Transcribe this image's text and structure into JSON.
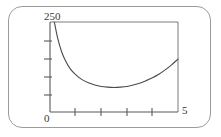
{
  "figure": {
    "name": "cost-curve-figure",
    "frame_style": "rounded-rectangle",
    "background_color": "#ffffff",
    "line_color": "#4a4a4a"
  },
  "chart_data": {
    "type": "line",
    "title": "",
    "subtitle": "",
    "xlabel": "",
    "ylabel": "",
    "xlim": [
      0,
      5
    ],
    "ylim": [
      0,
      250
    ],
    "grid": false,
    "legend": null,
    "axis_tick_labels": {
      "y_top": "250",
      "x_left": "0",
      "x_right": "5"
    },
    "y_ticks_unlabeled_count": 4,
    "x_ticks_unlabeled_count": 4,
    "y_tick_values": [
      50,
      100,
      150,
      200
    ],
    "x_tick_values": [
      1,
      2,
      3,
      4
    ],
    "series": [
      {
        "name": "curve",
        "x": [
          0.17,
          0.3,
          0.45,
          0.6,
          0.8,
          1.0,
          1.25,
          1.5,
          1.75,
          2.0,
          2.25,
          2.5,
          2.75,
          3.0,
          3.25,
          3.5,
          3.75,
          4.0,
          4.25,
          4.5,
          4.75,
          5.0
        ],
        "y": [
          250,
          205,
          168,
          143,
          119,
          104,
          90,
          81,
          75,
          71,
          69,
          68,
          69,
          71,
          75,
          80,
          87,
          95,
          105,
          117,
          131,
          147
        ]
      }
    ],
    "annotations": [],
    "minimum_point": {
      "x": 2.5,
      "y": 68
    }
  },
  "labels": {
    "y_max": "250",
    "x_min": "0",
    "x_max": "5"
  }
}
